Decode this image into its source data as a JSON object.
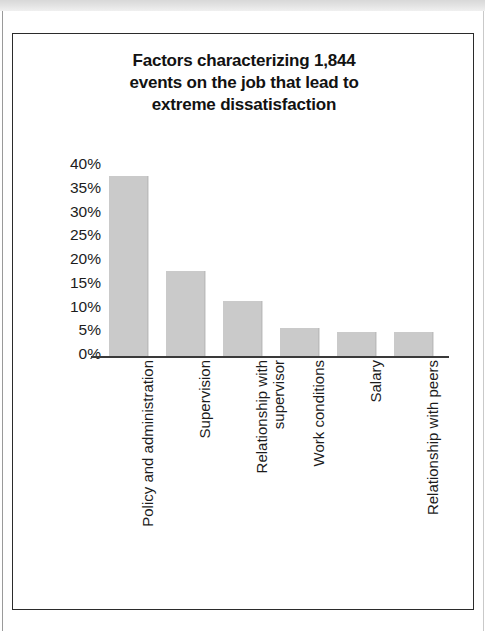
{
  "page": {
    "background_color": "#ffffff",
    "frame_border_color": "#2b2b2b"
  },
  "chart_data": {
    "type": "bar",
    "title": "Factors characterizing 1,844\nevents on the job that lead to\nextreme dissatisfaction",
    "xlabel": "",
    "ylabel": "",
    "ylim": [
      0,
      40
    ],
    "grid": false,
    "legend": null,
    "bar_color": "#cacaca",
    "categories": [
      "Policy and administration",
      "Supervision",
      "Relationship with\nsupervisor",
      "Work conditions",
      "Salary",
      "Relationship with peers"
    ],
    "values": [
      38,
      18,
      11.5,
      6,
      5,
      5
    ],
    "ytick_labels": [
      "40%",
      "35%",
      "30%",
      "25%",
      "20%",
      "15%",
      "10%",
      "5%",
      "0%"
    ],
    "ytick_values": [
      40,
      35,
      30,
      25,
      20,
      15,
      10,
      5,
      0
    ]
  }
}
